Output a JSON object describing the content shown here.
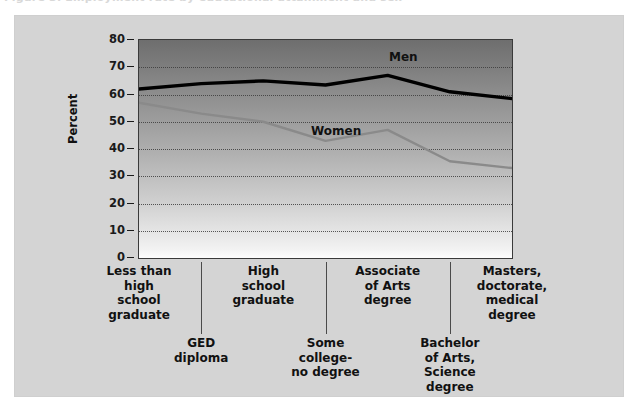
{
  "caption": {
    "ghost_text": "Figure 3.  Employment rate by educational attainment and sex"
  },
  "chart_data": {
    "type": "line",
    "title": "",
    "xlabel": "",
    "ylabel": "Percent",
    "ylim": [
      0,
      80
    ],
    "ytick_step": 10,
    "yticks": [
      "80",
      "70",
      "60",
      "50",
      "40",
      "30",
      "20",
      "10",
      "0"
    ],
    "grid": true,
    "legend_position": "inline-labels",
    "categories": [
      "Less than high school graduate",
      "GED diploma",
      "High school graduate",
      "Some college-no degree",
      "Associate of Arts degree",
      "Bachelor of Arts, Science degree",
      "Masters, doctorate, medical degree"
    ],
    "category_lines": [
      [
        "Less than",
        "high",
        "school",
        "graduate"
      ],
      [
        "GED",
        "diploma"
      ],
      [
        "High",
        "school",
        "graduate"
      ],
      [
        "Some",
        "college-",
        "no degree"
      ],
      [
        "Associate",
        "of Arts",
        "degree"
      ],
      [
        "Bachelor",
        "of Arts,",
        "Science",
        "degree"
      ],
      [
        "Masters,",
        "doctorate,",
        "medical",
        "degree"
      ]
    ],
    "series": [
      {
        "name": "Men",
        "color": "#000000",
        "values": [
          62,
          64,
          65,
          63.5,
          67,
          61,
          58.5
        ]
      },
      {
        "name": "Women",
        "color": "#8a8a8a",
        "values": [
          57,
          53,
          50,
          43,
          47,
          35.5,
          33
        ]
      }
    ]
  },
  "colors": {
    "panel_background": "#d4d4d4",
    "men_line": "#000000",
    "women_line": "#8a8a8a",
    "axis": "#1a1a1a",
    "gridline": "#3c3c3c"
  }
}
